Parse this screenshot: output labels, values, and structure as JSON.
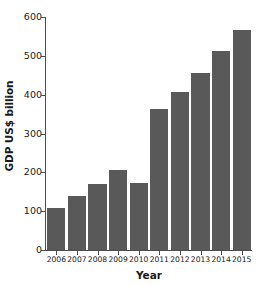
{
  "chart_data": {
    "type": "bar",
    "title": "",
    "xlabel": "Year",
    "ylabel": "GDP US$ billion",
    "categories": [
      "2006",
      "2007",
      "2008",
      "2009",
      "2010",
      "2011",
      "2012",
      "2013",
      "2014",
      "2015"
    ],
    "values": [
      108,
      140,
      170,
      207,
      172,
      362,
      406,
      456,
      513,
      566
    ],
    "ylim": [
      0,
      600
    ],
    "yticks": [
      0,
      100,
      200,
      300,
      400,
      500,
      600
    ],
    "ytick_labels": [
      "0",
      "100",
      "200",
      "300",
      "400",
      "500",
      "600"
    ],
    "grid": false,
    "legend": false,
    "bar_color": "#595959",
    "axis_color": "#4d4d4d",
    "text_color": "#1a1a1a",
    "background_color": "#ffffff"
  }
}
